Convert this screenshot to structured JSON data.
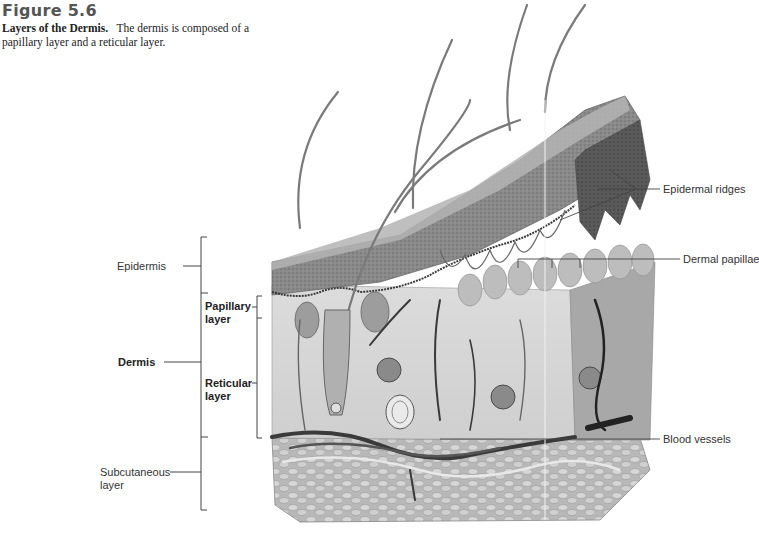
{
  "figure": {
    "number": "Figure 5.6",
    "caption_title": "Layers of the Dermis.",
    "caption_text": "The dermis is composed of a papillary layer and a reticular layer."
  },
  "labels": {
    "epidermis": "Epidermis",
    "dermis": "Dermis",
    "papillary_1": "Papillary",
    "papillary_2": "layer",
    "reticular_1": "Reticular",
    "reticular_2": "layer",
    "subcutaneous_1": "Subcutaneous",
    "subcutaneous_2": "layer",
    "epidermal_ridges": "Epidermal ridges",
    "dermal_papillae": "Dermal papillae",
    "blood_vessels": "Blood vessels"
  },
  "colors": {
    "epidermis_top": "#9a9a9a",
    "epidermis_dark": "#5e5e5e",
    "dermis": "#d8d8d8",
    "fat": "#c4c4c4",
    "vessel": "#3c3c3c",
    "leader_line": "#444444"
  }
}
